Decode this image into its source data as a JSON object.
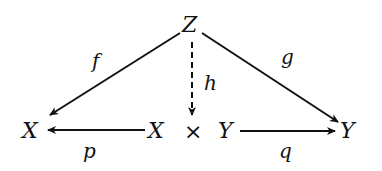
{
  "diagram": {
    "type": "commutative-diagram",
    "nodes": {
      "top": "Z",
      "left": "X",
      "center_left": "X",
      "center_op": "×",
      "center_right": "Y",
      "right": "Y"
    },
    "edges": [
      {
        "id": "f",
        "label": "f",
        "from": "Z",
        "to": "X",
        "style": "solid"
      },
      {
        "id": "g",
        "label": "g",
        "from": "Z",
        "to": "Y",
        "style": "solid"
      },
      {
        "id": "h",
        "label": "h",
        "from": "Z",
        "to": "X × Y",
        "style": "dashed"
      },
      {
        "id": "p",
        "label": "p",
        "from": "X × Y",
        "to": "X",
        "style": "solid"
      },
      {
        "id": "q",
        "label": "q",
        "from": "X × Y",
        "to": "Y",
        "style": "solid"
      }
    ],
    "colors": {
      "ink": "#111111",
      "background": "#ffffff"
    }
  }
}
